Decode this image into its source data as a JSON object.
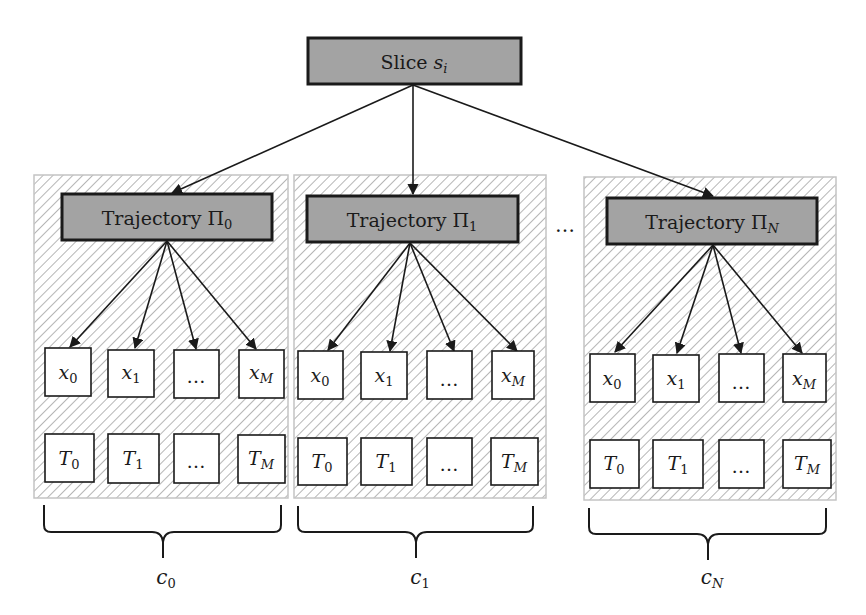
{
  "colors": {
    "box_fill": "#a3a3a3",
    "box_border": "#1a1a1a",
    "panel_border": "#c4c4c4",
    "hatch": "#8f8f8f",
    "leaf_fill": "#ffffff",
    "arrow": "#1a1a1a"
  },
  "root": {
    "label": "Slice",
    "symbol": "s",
    "subscript": "i"
  },
  "ellipsis_between_panels": "…",
  "panels": [
    {
      "trajectory": {
        "label": "Trajectory",
        "symbol": "Π",
        "subscript": "0"
      },
      "x_row": [
        {
          "sym": "x",
          "sub": "0"
        },
        {
          "sym": "x",
          "sub": "1"
        },
        {
          "sym": "…",
          "sub": ""
        },
        {
          "sym": "x",
          "sub": "M"
        }
      ],
      "t_row": [
        {
          "sym": "T",
          "sub": "0"
        },
        {
          "sym": "T",
          "sub": "1"
        },
        {
          "sym": "…",
          "sub": ""
        },
        {
          "sym": "T",
          "sub": "M"
        }
      ],
      "brace_label": {
        "sym": "c",
        "sub": "0"
      }
    },
    {
      "trajectory": {
        "label": "Trajectory",
        "symbol": "Π",
        "subscript": "1"
      },
      "x_row": [
        {
          "sym": "x",
          "sub": "0"
        },
        {
          "sym": "x",
          "sub": "1"
        },
        {
          "sym": "…",
          "sub": ""
        },
        {
          "sym": "x",
          "sub": "M"
        }
      ],
      "t_row": [
        {
          "sym": "T",
          "sub": "0"
        },
        {
          "sym": "T",
          "sub": "1"
        },
        {
          "sym": "…",
          "sub": ""
        },
        {
          "sym": "T",
          "sub": "M"
        }
      ],
      "brace_label": {
        "sym": "c",
        "sub": "1"
      }
    },
    {
      "trajectory": {
        "label": "Trajectory",
        "symbol": "Π",
        "subscript": "N"
      },
      "x_row": [
        {
          "sym": "x",
          "sub": "0"
        },
        {
          "sym": "x",
          "sub": "1"
        },
        {
          "sym": "…",
          "sub": ""
        },
        {
          "sym": "x",
          "sub": "M"
        }
      ],
      "t_row": [
        {
          "sym": "T",
          "sub": "0"
        },
        {
          "sym": "T",
          "sub": "1"
        },
        {
          "sym": "…",
          "sub": ""
        },
        {
          "sym": "T",
          "sub": "M"
        }
      ],
      "brace_label": {
        "sym": "c",
        "sub": "N"
      }
    }
  ]
}
